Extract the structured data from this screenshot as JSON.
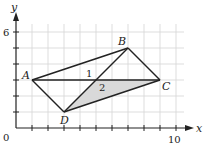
{
  "figure": {
    "axes": {
      "x_label": "x",
      "y_label": "y",
      "origin_label": "0",
      "x_tick_label": "10",
      "y_tick_label": "6",
      "x_range": [
        0,
        10
      ],
      "y_range": [
        0,
        6
      ],
      "grid": true,
      "grid_step": 1
    },
    "points": [
      {
        "name": "A",
        "x": 1,
        "y": 3
      },
      {
        "name": "B",
        "x": 7,
        "y": 5
      },
      {
        "name": "C",
        "x": 9,
        "y": 3
      },
      {
        "name": "D",
        "x": 3,
        "y": 1
      }
    ],
    "segments": [
      "AB",
      "BC",
      "CD",
      "DA",
      "AC",
      "DB"
    ],
    "regions": [
      {
        "label": "1",
        "shaded": false
      },
      {
        "label": "2",
        "shaded": true,
        "vertices": [
          [
            5,
            3
          ],
          [
            9,
            3
          ],
          [
            3,
            1
          ]
        ]
      }
    ],
    "colors": {
      "line": "#222222",
      "grid": "#d4d4d4",
      "shade": "#d9d9d9"
    }
  }
}
